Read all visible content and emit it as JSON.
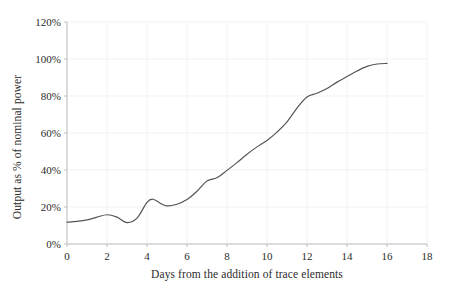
{
  "chart_data": {
    "type": "line",
    "title": "",
    "xlabel": "Days from the addition of trace elements",
    "ylabel": "Output as % of nominal power",
    "xlim": [
      0,
      18
    ],
    "ylim": [
      0,
      120
    ],
    "xticks": [
      0,
      2,
      4,
      6,
      8,
      10,
      12,
      14,
      16,
      18
    ],
    "xtick_labels": [
      "0",
      "2",
      "4",
      "6",
      "8",
      "10",
      "12",
      "14",
      "16",
      "18"
    ],
    "yticks": [
      0,
      20,
      40,
      60,
      80,
      100,
      120
    ],
    "ytick_labels": [
      "0%",
      "20%",
      "40%",
      "60%",
      "80%",
      "100%",
      "120%"
    ],
    "grid": true,
    "grid_color": "#ededed",
    "legend": false,
    "legend_position": "none",
    "axis_color": "#bfbfbf",
    "series": [
      {
        "name": "Output",
        "color": "#555555",
        "line_width": 1.2,
        "markers": false,
        "x": [
          0.0,
          0.5,
          1.0,
          1.5,
          2.0,
          2.5,
          3.0,
          3.5,
          4.0,
          4.3,
          4.7,
          5.0,
          5.5,
          6.0,
          6.5,
          7.0,
          7.5,
          8.0,
          8.5,
          9.0,
          9.5,
          10.0,
          10.5,
          11.0,
          11.5,
          12.0,
          12.5,
          13.0,
          13.5,
          14.0,
          14.5,
          15.0,
          15.5,
          16.0
        ],
        "y": [
          11.8,
          12.2,
          13.0,
          14.5,
          15.8,
          14.5,
          11.6,
          14.0,
          22.5,
          24.2,
          21.8,
          20.6,
          21.5,
          24.0,
          28.5,
          34.0,
          35.8,
          39.8,
          44.0,
          48.5,
          52.5,
          56.0,
          60.5,
          66.0,
          73.5,
          79.5,
          81.5,
          84.0,
          87.5,
          90.5,
          93.5,
          96.0,
          97.3,
          97.6
        ]
      }
    ]
  },
  "axes": {
    "y_title": "Output as % of nominal power",
    "x_title": "Days from the addition of trace elements",
    "y_tick_labels": [
      "120%",
      "100%",
      "80%",
      "60%",
      "40%",
      "20%",
      "0%"
    ],
    "x_tick_labels": [
      "0",
      "2",
      "4",
      "6",
      "8",
      "10",
      "12",
      "14",
      "16",
      "18"
    ]
  }
}
